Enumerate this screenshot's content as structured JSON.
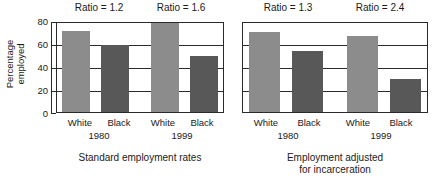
{
  "chart_data": {
    "type": "bar",
    "title": "",
    "subtitle": "",
    "xlabel": "",
    "ylabel": "Percentage employed",
    "ylabel_lines": [
      "Percentage",
      "employed"
    ],
    "ylim": [
      0,
      80
    ],
    "yticks": [
      0,
      20,
      40,
      60,
      80
    ],
    "ytick_labels": [
      "0",
      "20",
      "40",
      "60",
      "80"
    ],
    "grid": true,
    "grid_axis": "y",
    "legend": "none",
    "categories": [
      "White",
      "Black"
    ],
    "groups": [
      "1980",
      "1999"
    ],
    "colors": {
      "white_bar": "#8c8c8c",
      "black_bar": "#585858",
      "axis": "#2a2a2a",
      "background": "#ffffff",
      "text": "#1a1a1a"
    },
    "panels": [
      {
        "caption": "Standard employment rates",
        "caption_lines": [
          "Standard employment rates"
        ],
        "groups": [
          {
            "year": "1980",
            "annotation": "Ratio = 1.2",
            "ratio": 1.2,
            "bars": [
              {
                "category": "White",
                "value": 73
              },
              {
                "category": "Black",
                "value": 60
              }
            ]
          },
          {
            "year": "1999",
            "annotation": "Ratio = 1.6",
            "ratio": 1.6,
            "bars": [
              {
                "category": "White",
                "value": 80
              },
              {
                "category": "Black",
                "value": 50
              }
            ]
          }
        ]
      },
      {
        "caption": "Employment adjusted for incarceration",
        "caption_lines": [
          "Employment adjusted",
          "for incarceration"
        ],
        "groups": [
          {
            "year": "1980",
            "annotation": "Ratio = 1.3",
            "ratio": 1.3,
            "bars": [
              {
                "category": "White",
                "value": 72
              },
              {
                "category": "Black",
                "value": 55
              }
            ]
          },
          {
            "year": "1999",
            "annotation": "Ratio = 2.4",
            "ratio": 2.4,
            "bars": [
              {
                "category": "White",
                "value": 68
              },
              {
                "category": "Black",
                "value": 30
              }
            ]
          }
        ]
      }
    ]
  },
  "axis": {
    "ylabel_line1": "Percentage",
    "ylabel_line2": "employed",
    "ytick_0": "0",
    "ytick_20": "20",
    "ytick_40": "40",
    "ytick_60": "60",
    "ytick_80": "80"
  },
  "panel_left": {
    "ratio_1980": "Ratio = 1.2",
    "ratio_1999": "Ratio = 1.6",
    "cat_white_1980": "White",
    "cat_black_1980": "Black",
    "cat_white_1999": "White",
    "cat_black_1999": "Black",
    "group_1980": "1980",
    "group_1999": "1999",
    "caption": "Standard employment rates"
  },
  "panel_right": {
    "ratio_1980": "Ratio = 1.3",
    "ratio_1999": "Ratio = 2.4",
    "cat_white_1980": "White",
    "cat_black_1980": "Black",
    "cat_white_1999": "White",
    "cat_black_1999": "Black",
    "group_1980": "1980",
    "group_1999": "1999",
    "caption_line1": "Employment adjusted",
    "caption_line2": "for incarceration"
  }
}
